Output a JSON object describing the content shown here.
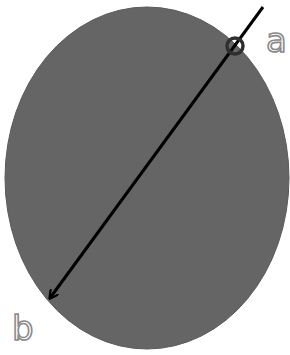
{
  "diagram": {
    "shape": "ellipse",
    "colors": {
      "ellipse_fill": "#656565",
      "arrow": "#000000",
      "marker": "#2f2f2f",
      "label_stroke": "#8a8a8a",
      "background": "#ffffff"
    },
    "labels": {
      "start": "a",
      "end": "b"
    }
  }
}
